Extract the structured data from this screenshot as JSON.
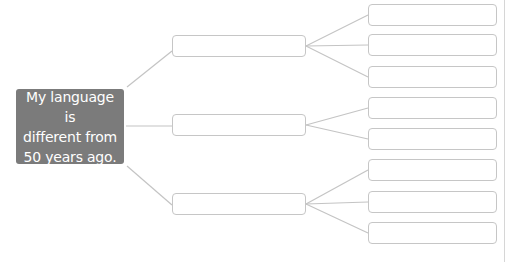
{
  "diagram": {
    "type": "tree",
    "root": {
      "text": "My language is\ndifferent from\n50 years ago.",
      "fill_color": "#7b7b7b",
      "text_color": "#ffffff"
    },
    "branches": [
      {
        "text": "",
        "children": [
          {
            "text": ""
          },
          {
            "text": ""
          },
          {
            "text": ""
          }
        ]
      },
      {
        "text": "",
        "children": [
          {
            "text": ""
          },
          {
            "text": ""
          }
        ]
      },
      {
        "text": "",
        "children": [
          {
            "text": ""
          },
          {
            "text": ""
          },
          {
            "text": ""
          }
        ]
      }
    ],
    "connector_color": "#c4c4c4",
    "box_border_color": "#c6c6c6"
  }
}
